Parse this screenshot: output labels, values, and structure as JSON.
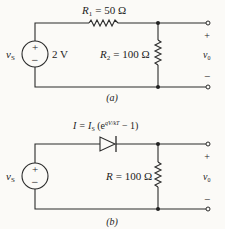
{
  "figure": {
    "circuit_a": {
      "caption": "(a)",
      "source": {
        "symbol": "v",
        "subscript": "S",
        "value": "2 V",
        "plus": "+",
        "minus": "−"
      },
      "r1": {
        "symbol": "R",
        "subscript": "1",
        "value": "= 50 Ω"
      },
      "r2": {
        "symbol": "R",
        "subscript": "2",
        "value": "= 100 Ω"
      },
      "output": {
        "symbol": "v",
        "subscript": "0",
        "plus": "+",
        "minus": "−"
      }
    },
    "circuit_b": {
      "caption": "(b)",
      "source": {
        "symbol": "v",
        "subscript": "S",
        "plus": "+",
        "minus": "−"
      },
      "diode": {
        "label_lhs": "I = I",
        "label_sub": "S",
        "label_mid": " (e",
        "label_exp": "qV/kT",
        "label_rhs": " − 1)"
      },
      "r": {
        "symbol": "R",
        "value": "= 100 Ω"
      },
      "output": {
        "symbol": "v",
        "subscript": "0",
        "plus": "+",
        "minus": "−"
      }
    }
  }
}
